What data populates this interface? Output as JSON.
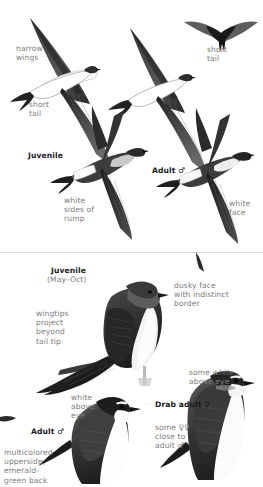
{
  "plate": {
    "title": "Tree Swallow field guide plate",
    "background": "#ffffff",
    "label_color": "#7d7d7d",
    "heading_color": "#1a1a1a",
    "divider_color": "#d9d9d9",
    "male_symbol": "♂",
    "female_symbol": "♀"
  },
  "flight_panel": {
    "labels": {
      "narrow_wings": "narrow\nwings",
      "short_tail_left": "short\ntail",
      "short_tail_top": "short\ntail",
      "juvenile": "Juvenile",
      "adult_male": "Adult ♂",
      "white_sides_of_rump": "white\nsides of\nrump",
      "white_face": "white\nface"
    }
  },
  "perched_panel": {
    "labels": {
      "juvenile": "Juvenile",
      "juvenile_months": "(May–Oct)",
      "wingtips": "wingtips\nproject\nbeyond\ntail tip",
      "dusky_face": "dusky face\nwith indistinct\nborder",
      "some_white_above_eye": "some white\nabove eye",
      "white_above_eye": "white\nabove\neye",
      "adult_male": "Adult ♂",
      "multicolored": "multicolored\nupperside;\nemerald-\ngreen back",
      "drab_adult_female": "Drab adult ♀",
      "some_females": "some ♀♀\nclose to\nadult ♂"
    }
  },
  "birds": [
    {
      "name": "swallow-flight-upper-left",
      "pose": "flight-underside"
    },
    {
      "name": "swallow-flight-upper-right",
      "pose": "flight-underside"
    },
    {
      "name": "swallow-flight-silhouette-top-right",
      "pose": "flight-silhouette"
    },
    {
      "name": "swallow-flight-juvenile",
      "pose": "flight-upperside"
    },
    {
      "name": "swallow-flight-adult-male",
      "pose": "flight-upperside"
    },
    {
      "name": "swallow-perched-juvenile",
      "pose": "perched"
    },
    {
      "name": "swallow-perched-adult-male",
      "pose": "perched"
    },
    {
      "name": "swallow-perched-drab-adult-female",
      "pose": "perched"
    }
  ]
}
